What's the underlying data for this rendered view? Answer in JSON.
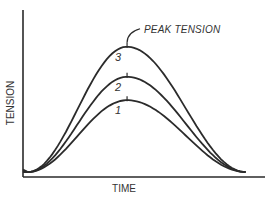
{
  "chart_data": {
    "type": "line",
    "title": "",
    "xlabel": "TIME",
    "ylabel": "TENSION",
    "xlim": [
      0,
      1
    ],
    "ylim": [
      0,
      1
    ],
    "grid": false,
    "x_ticks": [],
    "y_ticks": [],
    "series": [
      {
        "name": "1",
        "label": "1",
        "peak_x": 0.43,
        "peak_y": 0.46,
        "start_x": 0.02,
        "end_x": 0.92
      },
      {
        "name": "2",
        "label": "2",
        "peak_x": 0.43,
        "peak_y": 0.6,
        "start_x": 0.02,
        "end_x": 0.92
      },
      {
        "name": "3",
        "label": "3",
        "peak_x": 0.43,
        "peak_y": 0.78,
        "start_x": 0.02,
        "end_x": 0.92
      }
    ],
    "annotations": [
      {
        "text": "PEAK TENSION",
        "target_series": "3"
      }
    ],
    "peak_marks": true
  }
}
